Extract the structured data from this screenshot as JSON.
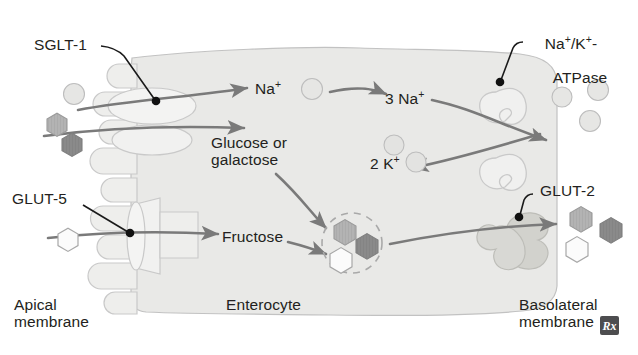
{
  "figure": {
    "cell_label": "Enterocyte",
    "apical_membrane_label": "Apical\nmembrane",
    "basolateral_membrane_label": "Basolateral\nmembrane",
    "badge_glyph": "Rx"
  },
  "transporters": [
    {
      "id": "sglt1",
      "label": "SGLT-1",
      "membrane": "apical",
      "shape": "oval"
    },
    {
      "id": "glut5",
      "label": "GLUT-5",
      "membrane": "apical",
      "shape": "barrel"
    },
    {
      "id": "atpase",
      "label": "Na+/K+-\nATPase",
      "label_line1": "Na",
      "label_line1_sup1": "+",
      "label_mid": "/K",
      "label_line1_sup2": "+",
      "label_dash": "-",
      "label_line2": "ATPase",
      "membrane": "basolateral",
      "shape": "hook-pair"
    },
    {
      "id": "glut2",
      "label": "GLUT-2",
      "membrane": "basolateral",
      "shape": "hourglass"
    }
  ],
  "solute_labels": [
    {
      "id": "na-apical",
      "text": "Na",
      "sup": "+",
      "x": 258,
      "y": 86
    },
    {
      "id": "glucose-gal",
      "text": "Glucose or\ngalactose",
      "sup": "",
      "x": 212,
      "y": 138
    },
    {
      "id": "na-3",
      "text": "3 Na",
      "sup": "+",
      "x": 388,
      "y": 98
    },
    {
      "id": "k-2",
      "text": "2 K",
      "sup": "+",
      "x": 374,
      "y": 160
    },
    {
      "id": "fructose",
      "text": "Fructose",
      "sup": "",
      "x": 224,
      "y": 236
    }
  ],
  "particles": {
    "ion_circle_color": "#e3e3e3",
    "ion_circle_stroke": "#b9b9b9",
    "hex_medium_color": "#b3b3b3",
    "hex_dark_color": "#8a8a8a",
    "hex_white_color": "#fbfbfb",
    "hex_stroke": "#9b9b9b",
    "counts": {
      "apical_outside_ions": 1,
      "apical_outside_hexes": 2,
      "cytosol_ions": 3,
      "cytosol_hexes": 3,
      "basolateral_outside_ions": 3,
      "basolateral_outside_hexes": 3
    }
  },
  "colors": {
    "cell_fill": "#e9e9e7",
    "membrane_stroke": "#c9c9c9",
    "arrow_color": "#7a7a7a",
    "leader_color": "#1a1a1a",
    "text_color": "#231f20",
    "transporter_fill": "#efefee",
    "glut2_fill": "#d6d6d2",
    "dashed_circle": "#a9a9a9"
  }
}
